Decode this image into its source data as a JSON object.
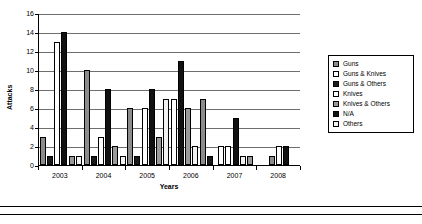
{
  "chart_data": {
    "type": "bar",
    "title": "",
    "xlabel": "Years",
    "ylabel": "Attacks",
    "categories": [
      "2003",
      "2004",
      "2005",
      "2006",
      "2007",
      "2008"
    ],
    "ylim": [
      0,
      16
    ],
    "ytick_step": 2,
    "yticks": [
      "0",
      "2",
      "4",
      "6",
      "8",
      "10",
      "12",
      "14",
      "16"
    ],
    "grid": true,
    "legend_position": "right",
    "series": [
      {
        "name": "Guns",
        "key": "guns",
        "swatch": "#8c8c8c",
        "values": [
          3,
          10,
          6,
          0,
          0,
          1
        ]
      },
      {
        "name": "Guns & Knives",
        "key": "gunsknives",
        "swatch": "#ffffff",
        "values": [
          0,
          0,
          0,
          0,
          2,
          0
        ]
      },
      {
        "name": "Guns & Others",
        "key": "gunsothers",
        "swatch": "#1a1a1a",
        "values": [
          1,
          0,
          0,
          0,
          0,
          0
        ]
      },
      {
        "name": "Knives",
        "key": "knives",
        "swatch": "#ffffff",
        "values": [
          13,
          3,
          6,
          7,
          2,
          2
        ]
      },
      {
        "name": "Knives & Others",
        "key": "knivesothers",
        "swatch": "#9a9a9a",
        "values": [
          0,
          0,
          0,
          0,
          0,
          0
        ]
      },
      {
        "name": "N/A",
        "key": "na",
        "swatch": "#111111",
        "values": [
          14,
          8,
          8,
          11,
          5,
          2
        ]
      },
      {
        "name": "Others",
        "key": "others",
        "swatch": "#f2f2f2",
        "values": [
          1,
          1,
          1,
          1,
          1,
          0
        ]
      }
    ],
    "bars": [
      {
        "year": "2003",
        "series": "Guns",
        "key": "guns",
        "value": 3
      },
      {
        "year": "2003",
        "series": "Guns & Others",
        "key": "gunsothers",
        "value": 1
      },
      {
        "year": "2003",
        "series": "Knives",
        "key": "knives",
        "value": 13
      },
      {
        "year": "2003",
        "series": "N/A",
        "key": "na",
        "value": 14
      },
      {
        "year": "2003",
        "series": "Knives & Others",
        "key": "knivesothers",
        "value": 1
      },
      {
        "year": "2003",
        "series": "Others",
        "key": "others",
        "value": 1
      },
      {
        "year": "2004",
        "series": "Guns",
        "key": "guns",
        "value": 10
      },
      {
        "year": "2004",
        "series": "Guns & Others",
        "key": "gunsothers",
        "value": 1
      },
      {
        "year": "2004",
        "series": "Knives",
        "key": "knives",
        "value": 3
      },
      {
        "year": "2004",
        "series": "N/A",
        "key": "na",
        "value": 8
      },
      {
        "year": "2004",
        "series": "Knives & Others",
        "key": "knivesothers",
        "value": 2
      },
      {
        "year": "2004",
        "series": "Others",
        "key": "others",
        "value": 1
      },
      {
        "year": "2005",
        "series": "Guns",
        "key": "guns",
        "value": 6
      },
      {
        "year": "2005",
        "series": "Guns & Others",
        "key": "gunsothers",
        "value": 1
      },
      {
        "year": "2005",
        "series": "Knives",
        "key": "knives",
        "value": 6
      },
      {
        "year": "2005",
        "series": "N/A",
        "key": "na",
        "value": 8
      },
      {
        "year": "2005",
        "series": "Knives & Others",
        "key": "knivesothers",
        "value": 3
      },
      {
        "year": "2005",
        "series": "Others",
        "key": "others",
        "value": 7
      },
      {
        "year": "2006",
        "series": "Knives",
        "key": "knives",
        "value": 7
      },
      {
        "year": "2006",
        "series": "N/A",
        "key": "na",
        "value": 11
      },
      {
        "year": "2006",
        "series": "Knives & Others",
        "key": "knivesothers",
        "value": 6
      },
      {
        "year": "2006",
        "series": "Others",
        "key": "others",
        "value": 2
      },
      {
        "year": "2006",
        "series": "Guns",
        "key": "guns",
        "value": 7
      },
      {
        "year": "2006",
        "series": "Guns & Others",
        "key": "gunsothers",
        "value": 1
      },
      {
        "year": "2007",
        "series": "Guns & Knives",
        "key": "gunsknives",
        "value": 2
      },
      {
        "year": "2007",
        "series": "Knives",
        "key": "knives",
        "value": 2
      },
      {
        "year": "2007",
        "series": "N/A",
        "key": "na",
        "value": 5
      },
      {
        "year": "2007",
        "series": "Others",
        "key": "others",
        "value": 1
      },
      {
        "year": "2007",
        "series": "Knives & Others",
        "key": "knivesothers",
        "value": 1
      },
      {
        "year": "2008",
        "series": "Guns",
        "key": "guns",
        "value": 1
      },
      {
        "year": "2008",
        "series": "Knives",
        "key": "knives",
        "value": 2
      },
      {
        "year": "2008",
        "series": "N/A",
        "key": "na",
        "value": 2
      }
    ]
  },
  "legend": {
    "items": [
      {
        "label": "Guns",
        "key": "guns"
      },
      {
        "label": "Guns & Knives",
        "key": "gunsknives"
      },
      {
        "label": "Guns & Others",
        "key": "gunsothers"
      },
      {
        "label": "Knives",
        "key": "knives"
      },
      {
        "label": "Knives & Others",
        "key": "knivesothers"
      },
      {
        "label": "N/A",
        "key": "na"
      },
      {
        "label": "Others",
        "key": "others"
      }
    ]
  }
}
